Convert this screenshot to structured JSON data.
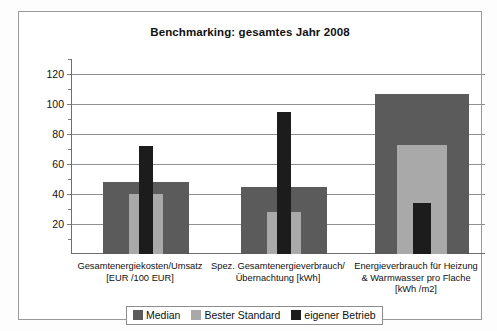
{
  "chart_data": {
    "type": "bar",
    "title": "Benchmarking: gesamtes Jahr 2008",
    "xlabel": "",
    "ylabel": "",
    "ylim": [
      0,
      130
    ],
    "grid": true,
    "legend_position": "bottom",
    "yticks": [
      20,
      40,
      60,
      80,
      100,
      120
    ],
    "categories": [
      "Gesamtenergiekosten/Umsatz\n[EUR /100 EUR]",
      "Spez. Gesamtenergieverbrauch/\nÜbernachtung [kWh]",
      "Energieverbrauch für Heizung\n& Warmwasser pro Flache\n[kWh /m2]"
    ],
    "category_lines": [
      [
        "Gesamtenergiekosten/Umsatz",
        "[EUR /100 EUR]"
      ],
      [
        "Spez. Gesamtenergieverbrauch/",
        "Übernachtung [kWh]"
      ],
      [
        "Energieverbrauch für Heizung",
        "& Warmwasser pro Flache",
        "[kWh /m2]"
      ]
    ],
    "series": [
      {
        "name": "Median",
        "color": "#5b5b5b",
        "values": [
          48,
          45,
          107
        ]
      },
      {
        "name": "Bester Standard",
        "color": "#a9a9a9",
        "values": [
          40,
          28,
          73
        ]
      },
      {
        "name": "eigener Betrieb",
        "color": "#1c1c1c",
        "values": [
          72,
          95,
          34
        ]
      }
    ]
  },
  "legend": {
    "items": [
      {
        "label": "Median"
      },
      {
        "label": "Bester Standard"
      },
      {
        "label": "eigener Betrieb"
      }
    ]
  }
}
